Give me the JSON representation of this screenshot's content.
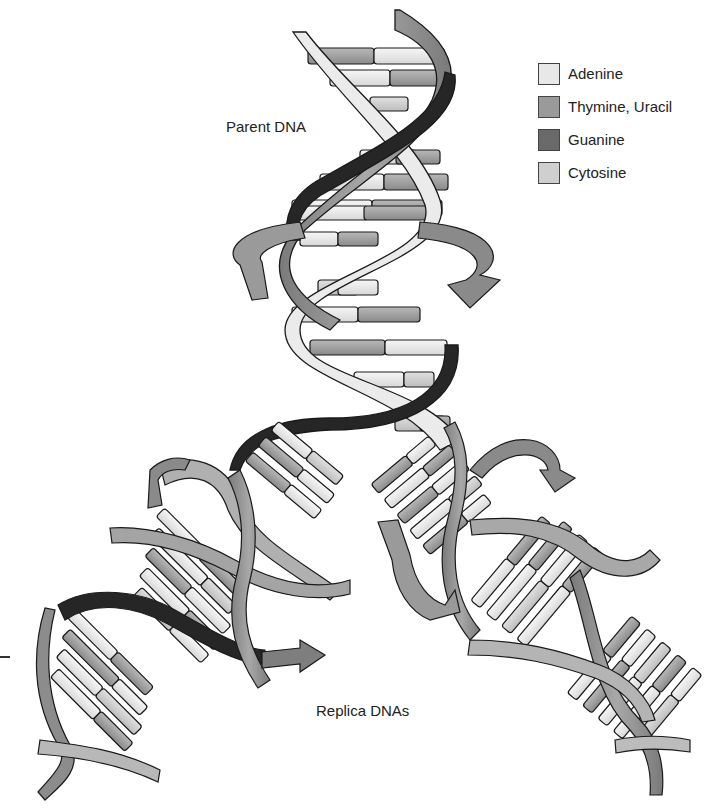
{
  "labels": {
    "parent": "Parent DNA",
    "replica": "Replica DNAs"
  },
  "legend": {
    "items": [
      {
        "label": "Adenine",
        "color": "#e8e8e8"
      },
      {
        "label": "Thymine, Uracil",
        "color": "#9a9a9a"
      },
      {
        "label": "Guanine",
        "color": "#6a6a6a"
      },
      {
        "label": "Cytosine",
        "color": "#cfcfcf"
      }
    ]
  },
  "colors": {
    "strand_dark": "#2a2a2a",
    "strand_mid": "#8a8a8a",
    "strand_light": "#e4e4e4",
    "outline": "#1a1a1a"
  }
}
